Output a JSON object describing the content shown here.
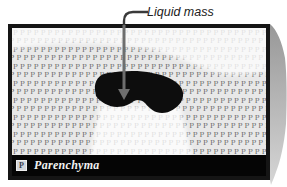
{
  "figure": {
    "annotation": {
      "label": "Liquid mass"
    },
    "legend": {
      "symbol": "P",
      "label": "Parenchyma"
    },
    "pattern": {
      "char": "P",
      "rows": 15,
      "cols": 40
    },
    "colors": {
      "frame": "#151515",
      "canvas_bg": "#e8e8e8",
      "pattern_ink": "#666666",
      "mass_fill": "#0d0d0d",
      "arrow": "#6e6e6e",
      "connector": "#3a3a3a",
      "label_ink": "#222222",
      "legend_bg": "#050505",
      "legend_text": "#f2f2f2",
      "chip_bg": "#d2d5da",
      "chip_border": "#eeeeee",
      "chip_ink": "#39404d",
      "edge_dark": "#989898",
      "edge_light": "#d6d6d6"
    }
  }
}
